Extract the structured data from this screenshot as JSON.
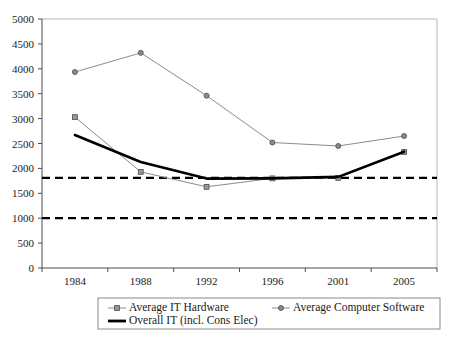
{
  "chart_data": {
    "type": "line",
    "title": "",
    "xlabel": "",
    "ylabel": "",
    "categories": [
      "1984",
      "1988",
      "1992",
      "1996",
      "2001",
      "2005"
    ],
    "ylim": [
      0,
      5000
    ],
    "ytick_step": 500,
    "yticks": [
      "0",
      "500",
      "1000",
      "1500",
      "2000",
      "2500",
      "3000",
      "3500",
      "4000",
      "4500",
      "5000"
    ],
    "grid": false,
    "legend_position": "below-axes",
    "series": [
      {
        "name": "Average IT Hardware",
        "marker": "square",
        "style": "thin-gray",
        "values": [
          3030,
          1930,
          1630,
          1800,
          1810,
          2330
        ]
      },
      {
        "name": "Average Computer Software",
        "marker": "circle",
        "style": "thin-gray",
        "values": [
          3935,
          4320,
          3460,
          2520,
          2450,
          2650
        ]
      },
      {
        "name": "Overall IT (incl. Cons Elec)",
        "marker": "none",
        "style": "thick-black",
        "values": [
          2670,
          2130,
          1795,
          1800,
          1830,
          2335
        ]
      }
    ],
    "reference_lines": [
      {
        "name": "upper-reference",
        "value": 1810,
        "style": "dashed-black"
      },
      {
        "name": "lower-reference",
        "value": 1000,
        "style": "dashed-black"
      }
    ]
  },
  "legend": {
    "entries": [
      {
        "label": "Average IT Hardware",
        "marker": "square"
      },
      {
        "label": "Average Computer Software",
        "marker": "circle"
      },
      {
        "label": "Overall IT (incl. Cons Elec)",
        "marker": "line"
      }
    ]
  },
  "colors": {
    "series_gray": "#8c8c8c",
    "series_black": "#000000",
    "axis": "#4d4d4d",
    "frame": "#b5b5b5",
    "background": "#ffffff"
  }
}
